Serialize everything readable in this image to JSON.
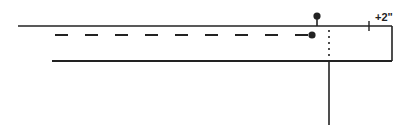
{
  "diagram": {
    "stroke_color": "#222222",
    "background": "#ffffff",
    "labels": {
      "offset": "+2\""
    },
    "elements": {
      "top_line": {
        "x1": 18,
        "y": 26,
        "x2": 392
      },
      "bottom_line": {
        "x1": 52,
        "y": 61,
        "x2": 392
      },
      "right_edge": {
        "x": 392,
        "y1": 26,
        "y2": 61
      },
      "dashed_line": {
        "x1": 55,
        "y": 35,
        "x2": 310
      },
      "moving_dot": {
        "cx": 312,
        "cy": 35
      },
      "fixed_lollipop": {
        "x": 317,
        "dot_y": 16,
        "base_y": 26
      },
      "dotted_guide": {
        "x": 329,
        "y1": 30,
        "y2": 60
      },
      "vertical_stem": {
        "x": 329,
        "y1": 61,
        "y2": 125
      },
      "offset_tick": {
        "x": 369,
        "y1": 21,
        "y2": 31
      }
    }
  }
}
